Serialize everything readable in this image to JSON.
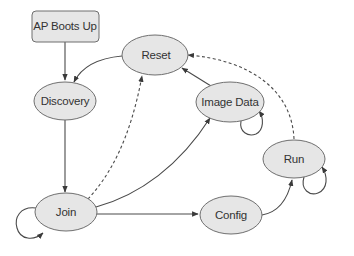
{
  "diagram": {
    "type": "state-machine",
    "nodes": [
      {
        "id": "ap_boots_up",
        "label": "AP Boots Up",
        "shape": "rounded-rect"
      },
      {
        "id": "discovery",
        "label": "Discovery",
        "shape": "ellipse"
      },
      {
        "id": "reset",
        "label": "Reset",
        "shape": "ellipse"
      },
      {
        "id": "image_data",
        "label": "Image Data",
        "shape": "ellipse"
      },
      {
        "id": "run",
        "label": "Run",
        "shape": "ellipse"
      },
      {
        "id": "join",
        "label": "Join",
        "shape": "ellipse"
      },
      {
        "id": "config",
        "label": "Config",
        "shape": "ellipse"
      }
    ],
    "edges": [
      {
        "from": "ap_boots_up",
        "to": "discovery",
        "style": "solid"
      },
      {
        "from": "reset",
        "to": "discovery",
        "style": "solid"
      },
      {
        "from": "discovery",
        "to": "join",
        "style": "solid"
      },
      {
        "from": "join",
        "to": "join",
        "style": "solid",
        "self_loop": true
      },
      {
        "from": "join",
        "to": "reset",
        "style": "dashed"
      },
      {
        "from": "join",
        "to": "image_data",
        "style": "solid"
      },
      {
        "from": "join",
        "to": "config",
        "style": "solid"
      },
      {
        "from": "image_data",
        "to": "reset",
        "style": "solid"
      },
      {
        "from": "image_data",
        "to": "image_data",
        "style": "solid",
        "self_loop": true
      },
      {
        "from": "config",
        "to": "run",
        "style": "solid"
      },
      {
        "from": "run",
        "to": "run",
        "style": "solid",
        "self_loop": true
      },
      {
        "from": "run",
        "to": "reset",
        "style": "dashed"
      }
    ],
    "colors": {
      "node_fill": "#e6e6e6",
      "node_stroke": "#6f6f6f",
      "edge": "#4a4a4a",
      "text": "#333333",
      "background": "#ffffff"
    }
  }
}
